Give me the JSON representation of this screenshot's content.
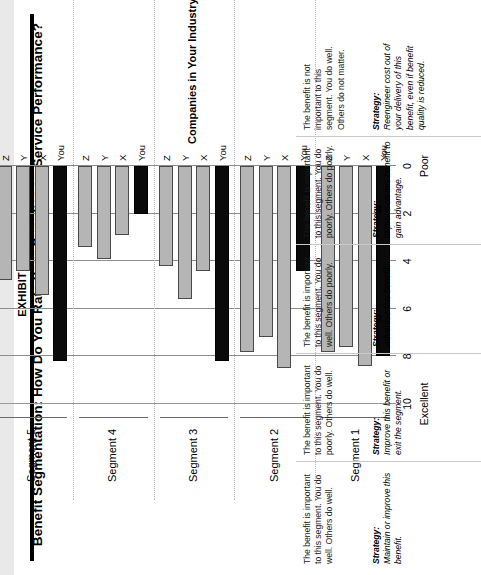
{
  "exhibit": {
    "number": "EXHIBIT 8-4",
    "title": "Benefit Segmentation: How Do You Rate Your Supplier on Service Performance?"
  },
  "chart_data": {
    "type": "bar",
    "orientation": "horizontal-grouped",
    "title": "Benefit Segmentation: How Do You Rate Your Supplier on Service Performance?",
    "xlabel": "Companies in Your Industry",
    "ylabel": "",
    "ylim": [
      0,
      10
    ],
    "axis_low_label": "Poor",
    "axis_high_label": "Excellent",
    "tick_labels": [
      "10",
      "8",
      "6",
      "4",
      "2",
      "0"
    ],
    "tick_values": [
      10,
      8,
      6,
      4,
      2,
      0
    ],
    "grid": true,
    "legend": "none",
    "series_names": [
      "You",
      "X",
      "Y",
      "Z"
    ],
    "categories": [
      "Segment 1",
      "Segment 2",
      "Segment 3",
      "Segment 4",
      "Segment 5"
    ],
    "groups": [
      {
        "name": "Segment 1",
        "bars": [
          {
            "label": "You",
            "value": 8.0,
            "style": "you"
          },
          {
            "label": "X",
            "value": 8.4,
            "style": "other"
          },
          {
            "label": "Y",
            "value": 7.6,
            "style": "other"
          },
          {
            "label": "Z",
            "value": 7.8,
            "style": "other"
          }
        ]
      },
      {
        "name": "Segment 2",
        "bars": [
          {
            "label": "You",
            "value": 4.4,
            "style": "you"
          },
          {
            "label": "X",
            "value": 8.5,
            "style": "other"
          },
          {
            "label": "Y",
            "value": 7.2,
            "style": "other"
          },
          {
            "label": "Z",
            "value": 7.8,
            "style": "other"
          }
        ]
      },
      {
        "name": "Segment 3",
        "bars": [
          {
            "label": "You",
            "value": 8.2,
            "style": "you"
          },
          {
            "label": "X",
            "value": 4.4,
            "style": "other"
          },
          {
            "label": "Y",
            "value": 5.6,
            "style": "other"
          },
          {
            "label": "Z",
            "value": 4.2,
            "style": "other"
          }
        ]
      },
      {
        "name": "Segment 4",
        "bars": [
          {
            "label": "You",
            "value": 2.0,
            "style": "you"
          },
          {
            "label": "X",
            "value": 2.9,
            "style": "other"
          },
          {
            "label": "Y",
            "value": 3.9,
            "style": "other"
          },
          {
            "label": "Z",
            "value": 3.4,
            "style": "other"
          }
        ]
      },
      {
        "name": "Segment 5",
        "bars": [
          {
            "label": "You",
            "value": 8.2,
            "style": "you"
          },
          {
            "label": "X",
            "value": 5.4,
            "style": "other"
          },
          {
            "label": "Y",
            "value": 4.4,
            "style": "other"
          },
          {
            "label": "Z",
            "value": 4.8,
            "style": "other"
          }
        ]
      }
    ]
  },
  "notes": [
    {
      "segment": "Segment 1",
      "description": "The benefit is important to this segment. You do well. Others do well.",
      "strategy_label": "Strategy:",
      "strategy": "Maintain or improve this benefit."
    },
    {
      "segment": "Segment 2",
      "description": "The benefit is important to this segment. You do poorly. Others do well.",
      "strategy_label": "Strategy:",
      "strategy": "Improve this benefit or exit the segment."
    },
    {
      "segment": "Segment 3",
      "description": "The benefit is important to this segment. You do well. Others do poorly.",
      "strategy_label": "Strategy:",
      "strategy": "Advertise this benefit."
    },
    {
      "segment": "Segment 4",
      "description": "The benefit is important to this segment. You do poorly. Others do poorly.",
      "strategy_label": "Strategy:",
      "strategy": "Improve on this benefit to gain advantage."
    },
    {
      "segment": "Segment 5",
      "description": "The benefit is not important to this segment. You do well. Others do not matter.",
      "strategy_label": "Strategy:",
      "strategy": "Reengineer cost out of your delivery of this benefit, even if benefit quality is reduced."
    }
  ],
  "colors": {
    "you_bar": "#0a0a0a",
    "other_bar": "#b5b5b5",
    "grid": "#8d8d8d",
    "page": "#ffffff"
  }
}
